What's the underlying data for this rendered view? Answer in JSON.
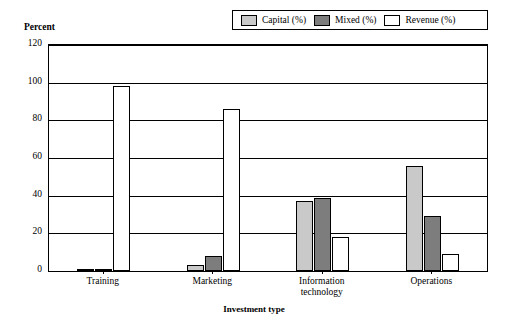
{
  "chart_data": {
    "type": "bar",
    "title": "",
    "ylabel": "Percent",
    "xlabel": "Investment type",
    "categories": [
      "Training",
      "Marketing",
      "Information technology",
      "Operations"
    ],
    "series": [
      {
        "name": "Capital (%)",
        "values": [
          1,
          3,
          37,
          56
        ],
        "color": "#c9c9c9"
      },
      {
        "name": "Mixed (%)",
        "values": [
          1,
          8,
          39,
          29
        ],
        "color": "#7d7d7d"
      },
      {
        "name": "Revenue (%)",
        "values": [
          98,
          86,
          18,
          9
        ],
        "color": "#ffffff"
      }
    ],
    "ylim": [
      0,
      120
    ],
    "yticks": [
      "0",
      "20",
      "40",
      "60",
      "80",
      "100",
      "120"
    ],
    "grid": true,
    "legend_position": "top-right"
  },
  "legend": {
    "items": [
      {
        "label": "Capital (%)",
        "color": "#c9c9c9"
      },
      {
        "label": "Mixed (%)",
        "color": "#7d7d7d"
      },
      {
        "label": "Revenue (%)",
        "color": "#ffffff"
      }
    ]
  },
  "axes": {
    "y_title": "Percent",
    "x_title": "Investment type",
    "y_ticks": [
      "120",
      "100",
      "80",
      "60",
      "40",
      "20",
      "0"
    ],
    "x_ticks": [
      {
        "line1": "Training",
        "line2": ""
      },
      {
        "line1": "Marketing",
        "line2": ""
      },
      {
        "line1": "Information",
        "line2": "technology"
      },
      {
        "line1": "Operations",
        "line2": ""
      }
    ]
  }
}
